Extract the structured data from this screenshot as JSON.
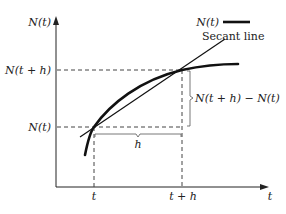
{
  "diagram": {
    "y_axis_label": "N(t)",
    "x_axis_label": "t",
    "y_ticks": [
      "N(t + h)",
      "N(t)"
    ],
    "x_ticks": [
      "t",
      "t + h"
    ],
    "legend": {
      "curve_label": "N(t)",
      "secant_label": "Secant line"
    },
    "annotations": {
      "horizontal_gap": "h",
      "vertical_gap": "N(t + h) − N(t)"
    },
    "colors": {
      "curve": "#111111",
      "secant": "#111111",
      "axes": "#222222",
      "dashed": "#444444"
    }
  }
}
